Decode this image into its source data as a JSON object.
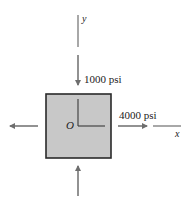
{
  "diagram": {
    "type": "plane-stress-element",
    "element": {
      "fill": "#c8c8c8",
      "stroke": "#2a2a2a",
      "origin_label": "O"
    },
    "axes": {
      "x_label": "x",
      "y_label": "y"
    },
    "stresses": [
      {
        "direction": "y",
        "label": "1000 psi",
        "sense": "compression"
      },
      {
        "direction": "x",
        "label": "4000 psi",
        "sense": "tension"
      }
    ],
    "colors": {
      "arrow": "#6e6e6e",
      "text": "#222222"
    }
  }
}
